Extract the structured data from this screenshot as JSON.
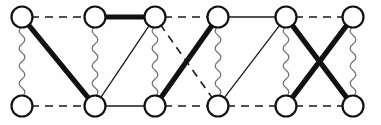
{
  "figure": {
    "name": "two-row-graph-diagram",
    "width": 381,
    "height": 125,
    "background_color": "#fefefe",
    "vertex_fill_color": "#ffffff",
    "vertex_stroke_color": "#111111",
    "vertex_radius": 10.5,
    "vertex_stroke_width": 2.2
  },
  "edge_styles": {
    "thick": {
      "name": "thick-solid-edge",
      "color": "#111111",
      "width": 5.2
    },
    "thin": {
      "name": "thin-solid-edge",
      "color": "#1a1a1a",
      "width": 1.3
    },
    "dashed": {
      "name": "dashed-edge",
      "color": "#1a1a1a",
      "width": 1.6,
      "dash": "8 6"
    },
    "wavy": {
      "name": "wavy-edge",
      "color": "#6f6f6f",
      "width": 1.25,
      "amplitude": 3.0,
      "period": 9
    }
  },
  "vertices": [
    {
      "id": "t1",
      "row": "top",
      "index": 1,
      "x": 22,
      "y": 17
    },
    {
      "id": "t2",
      "row": "top",
      "index": 2,
      "x": 95,
      "y": 17
    },
    {
      "id": "t3",
      "row": "top",
      "index": 3,
      "x": 155,
      "y": 17
    },
    {
      "id": "t4",
      "row": "top",
      "index": 4,
      "x": 218,
      "y": 17
    },
    {
      "id": "t5",
      "row": "top",
      "index": 5,
      "x": 286,
      "y": 17
    },
    {
      "id": "t6",
      "row": "top",
      "index": 6,
      "x": 353,
      "y": 17
    },
    {
      "id": "b1",
      "row": "bottom",
      "index": 1,
      "x": 22,
      "y": 106
    },
    {
      "id": "b2",
      "row": "bottom",
      "index": 2,
      "x": 95,
      "y": 106
    },
    {
      "id": "b3",
      "row": "bottom",
      "index": 3,
      "x": 155,
      "y": 106
    },
    {
      "id": "b4",
      "row": "bottom",
      "index": 4,
      "x": 218,
      "y": 106
    },
    {
      "id": "b5",
      "row": "bottom",
      "index": 5,
      "x": 286,
      "y": 106
    },
    {
      "id": "b6",
      "row": "bottom",
      "index": 6,
      "x": 353,
      "y": 106
    }
  ],
  "edges": [
    {
      "from": "t1",
      "to": "t2",
      "style": "dashed",
      "group": "top-row"
    },
    {
      "from": "t2",
      "to": "t3",
      "style": "thick",
      "group": "top-row"
    },
    {
      "from": "t3",
      "to": "t4",
      "style": "dashed",
      "group": "top-row"
    },
    {
      "from": "t4",
      "to": "t5",
      "style": "thin",
      "group": "top-row"
    },
    {
      "from": "t5",
      "to": "t6",
      "style": "dashed",
      "group": "top-row"
    },
    {
      "from": "b1",
      "to": "b2",
      "style": "dashed",
      "group": "bottom-row"
    },
    {
      "from": "b2",
      "to": "b3",
      "style": "thin",
      "group": "bottom-row"
    },
    {
      "from": "b3",
      "to": "b4",
      "style": "dashed",
      "group": "bottom-row"
    },
    {
      "from": "b4",
      "to": "b5",
      "style": "dashed",
      "group": "bottom-row"
    },
    {
      "from": "b5",
      "to": "b6",
      "style": "dashed",
      "group": "bottom-row"
    },
    {
      "from": "t1",
      "to": "b1",
      "style": "wavy",
      "group": "vertical"
    },
    {
      "from": "t2",
      "to": "b2",
      "style": "wavy",
      "group": "vertical"
    },
    {
      "from": "t3",
      "to": "b3",
      "style": "wavy",
      "group": "vertical"
    },
    {
      "from": "t4",
      "to": "b4",
      "style": "wavy",
      "group": "vertical"
    },
    {
      "from": "t5",
      "to": "b5",
      "style": "wavy",
      "group": "vertical"
    },
    {
      "from": "t6",
      "to": "b6",
      "style": "wavy",
      "group": "vertical"
    },
    {
      "from": "t1",
      "to": "b2",
      "style": "thick",
      "group": "diagonal"
    },
    {
      "from": "t3",
      "to": "b2",
      "style": "thin",
      "group": "diagonal"
    },
    {
      "from": "t3",
      "to": "b4",
      "style": "dashed",
      "group": "diagonal"
    },
    {
      "from": "t4",
      "to": "b3",
      "style": "thick",
      "group": "diagonal"
    },
    {
      "from": "t5",
      "to": "b4",
      "style": "thin",
      "group": "diagonal"
    },
    {
      "from": "t5",
      "to": "b6",
      "style": "thick",
      "group": "diagonal"
    },
    {
      "from": "t6",
      "to": "b5",
      "style": "thick",
      "group": "diagonal"
    }
  ]
}
